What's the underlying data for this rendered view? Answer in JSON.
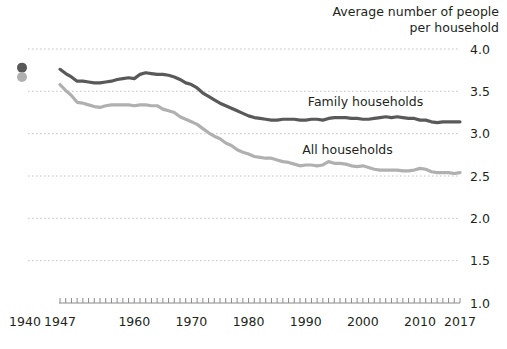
{
  "chart_data": {
    "type": "line",
    "title": "Average number of people\nper household",
    "xlabel": "",
    "ylabel": "",
    "ylim": [
      1.0,
      4.0
    ],
    "xlim": [
      1947,
      2017
    ],
    "grid": true,
    "legend_position": "inline-right",
    "ytick_labels": [
      "4.0",
      "3.5",
      "3.0",
      "2.5",
      "2.0",
      "1.5",
      "1.0"
    ],
    "ytick_values": [
      4.0,
      3.5,
      3.0,
      2.5,
      2.0,
      1.5,
      1.0
    ],
    "xtick_labels": [
      "1940",
      "1947",
      "1960",
      "1970",
      "1980",
      "1990",
      "2000",
      "2010",
      "2017"
    ],
    "xtick_values": [
      1940,
      1947,
      1960,
      1970,
      1980,
      1990,
      2000,
      2010,
      2017
    ],
    "annotations": [
      {
        "text": "Family households",
        "x": 2000,
        "y": 3.33
      },
      {
        "text": "All households",
        "x": 1999,
        "y": 2.76
      }
    ],
    "detached_points": [
      {
        "series": "Family households",
        "x": 1940,
        "y": 3.78,
        "color": "#595959"
      },
      {
        "series": "All households",
        "x": 1940,
        "y": 3.67,
        "color": "#b0b0b0"
      }
    ],
    "series": [
      {
        "name": "Family households",
        "color": "#595959",
        "x": [
          1947,
          1948,
          1949,
          1950,
          1951,
          1952,
          1953,
          1954,
          1955,
          1956,
          1957,
          1958,
          1959,
          1960,
          1961,
          1962,
          1963,
          1964,
          1965,
          1966,
          1967,
          1968,
          1969,
          1970,
          1971,
          1972,
          1973,
          1974,
          1975,
          1976,
          1977,
          1978,
          1979,
          1980,
          1981,
          1982,
          1983,
          1984,
          1985,
          1986,
          1987,
          1988,
          1989,
          1990,
          1991,
          1992,
          1993,
          1994,
          1995,
          1996,
          1997,
          1998,
          1999,
          2000,
          2001,
          2002,
          2003,
          2004,
          2005,
          2006,
          2007,
          2008,
          2009,
          2010,
          2011,
          2012,
          2013,
          2014,
          2015,
          2016,
          2017
        ],
        "values": [
          3.76,
          3.71,
          3.67,
          3.62,
          3.62,
          3.61,
          3.6,
          3.6,
          3.61,
          3.62,
          3.64,
          3.65,
          3.66,
          3.65,
          3.7,
          3.72,
          3.71,
          3.7,
          3.7,
          3.69,
          3.67,
          3.64,
          3.6,
          3.58,
          3.54,
          3.48,
          3.44,
          3.4,
          3.36,
          3.33,
          3.3,
          3.27,
          3.24,
          3.21,
          3.19,
          3.18,
          3.17,
          3.16,
          3.16,
          3.17,
          3.17,
          3.17,
          3.16,
          3.16,
          3.17,
          3.17,
          3.16,
          3.18,
          3.19,
          3.19,
          3.19,
          3.18,
          3.18,
          3.17,
          3.17,
          3.18,
          3.19,
          3.2,
          3.19,
          3.2,
          3.19,
          3.18,
          3.18,
          3.16,
          3.16,
          3.14,
          3.13,
          3.14,
          3.14,
          3.14,
          3.14
        ]
      },
      {
        "name": "All households",
        "color": "#b0b0b0",
        "x": [
          1947,
          1948,
          1949,
          1950,
          1951,
          1952,
          1953,
          1954,
          1955,
          1956,
          1957,
          1958,
          1959,
          1960,
          1961,
          1962,
          1963,
          1964,
          1965,
          1966,
          1967,
          1968,
          1969,
          1970,
          1971,
          1972,
          1973,
          1974,
          1975,
          1976,
          1977,
          1978,
          1979,
          1980,
          1981,
          1982,
          1983,
          1984,
          1985,
          1986,
          1987,
          1988,
          1989,
          1990,
          1991,
          1992,
          1993,
          1994,
          1995,
          1996,
          1997,
          1998,
          1999,
          2000,
          2001,
          2002,
          2003,
          2004,
          2005,
          2006,
          2007,
          2008,
          2009,
          2010,
          2011,
          2012,
          2013,
          2014,
          2015,
          2016,
          2017
        ],
        "values": [
          3.58,
          3.51,
          3.45,
          3.37,
          3.36,
          3.34,
          3.32,
          3.31,
          3.33,
          3.34,
          3.34,
          3.34,
          3.34,
          3.33,
          3.34,
          3.34,
          3.33,
          3.33,
          3.29,
          3.27,
          3.25,
          3.2,
          3.17,
          3.14,
          3.11,
          3.06,
          3.01,
          2.97,
          2.94,
          2.89,
          2.86,
          2.81,
          2.78,
          2.76,
          2.73,
          2.72,
          2.71,
          2.71,
          2.69,
          2.67,
          2.66,
          2.64,
          2.62,
          2.63,
          2.63,
          2.62,
          2.63,
          2.67,
          2.65,
          2.65,
          2.64,
          2.62,
          2.61,
          2.62,
          2.6,
          2.58,
          2.57,
          2.57,
          2.57,
          2.57,
          2.56,
          2.56,
          2.57,
          2.59,
          2.58,
          2.55,
          2.54,
          2.54,
          2.54,
          2.53,
          2.54
        ]
      }
    ]
  }
}
